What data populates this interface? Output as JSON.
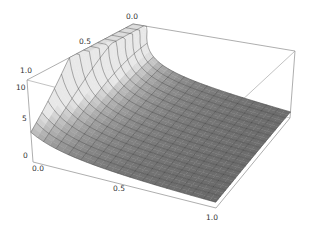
{
  "chart_data": {
    "type": "surface3d",
    "title": "",
    "xlabel": "",
    "ylabel": "",
    "zlabel": "",
    "x_range": [
      0,
      1
    ],
    "y_range": [
      0,
      1
    ],
    "z_range": [
      0,
      11
    ],
    "x_ticks": [
      "0.0",
      "0.5",
      "1.0"
    ],
    "y_ticks": [
      "0.0",
      "0.5",
      "1.0"
    ],
    "z_ticks": [
      "0",
      "5",
      "10"
    ],
    "function_description": "decaying surface, approx z = 1/(x + 0.25*y^2), clipped at 11",
    "clip_z": 11,
    "mesh_count": 15,
    "grid_samples": {
      "x": [
        0,
        0.1,
        0.2,
        0.3,
        0.4,
        0.5,
        0.6,
        0.7,
        0.8,
        0.9,
        1.0
      ],
      "y_0.0": [
        11,
        10,
        5,
        3.33,
        2.5,
        2,
        1.67,
        1.43,
        1.25,
        1.11,
        1
      ],
      "y_0.5": [
        11,
        6.15,
        3.81,
        2.76,
        2.16,
        1.78,
        1.51,
        1.31,
        1.16,
        1.04,
        0.94
      ],
      "y_1.0": [
        4,
        2.86,
        2.22,
        1.82,
        1.54,
        1.33,
        1.18,
        1.05,
        0.95,
        0.87,
        0.8
      ]
    },
    "colors": {
      "surface_light": "#ececec",
      "surface_dark": "#5a5a5a",
      "mesh": "#3a3a3a",
      "box": "#999999"
    }
  }
}
